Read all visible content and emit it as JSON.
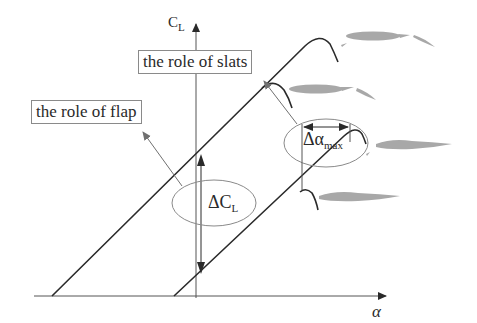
{
  "diagram": {
    "title": "",
    "axes": {
      "y_label_main": "C",
      "y_label_sub": "L",
      "x_label": "α"
    },
    "callouts": {
      "slats": "the role of slats",
      "flap": "the role of flap"
    },
    "annotations": {
      "delta_cl_main": "ΔC",
      "delta_cl_sub": "L",
      "delta_alpha_main": "Δα",
      "delta_alpha_sub": "max"
    },
    "curves": [
      {
        "name": "flap-and-slat-curve",
        "description": "upper lift line with slat stall extension"
      },
      {
        "name": "flap-curve",
        "description": "upper lift line, flap only stall"
      },
      {
        "name": "slat-curve",
        "description": "lower lift line with slat stall extension"
      },
      {
        "name": "clean-curve",
        "description": "lower lift line, clean airfoil stall"
      }
    ],
    "airfoil_icons": [
      "airfoil-slat-and-flap",
      "airfoil-flap",
      "airfoil-slat",
      "airfoil-clean"
    ],
    "colors": {
      "line": "#2a2a2a",
      "thin_line": "#707070",
      "airfoil": "#a8a8a8"
    }
  }
}
